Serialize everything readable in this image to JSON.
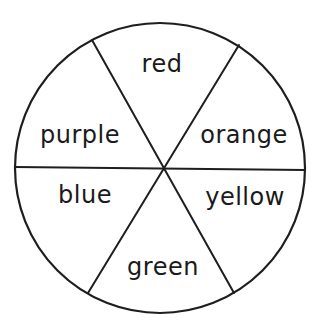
{
  "diagram": {
    "type": "color-wheel",
    "sectors": 6,
    "line_color": "#1e1e1e",
    "background": "#ffffff",
    "labels": {
      "top": "red",
      "upper_left": "purple",
      "upper_right": "orange",
      "lower_left": "blue",
      "lower_right": "yellow",
      "bottom": "green"
    },
    "order_clockwise_from_top": [
      "red",
      "orange",
      "yellow",
      "green",
      "blue",
      "purple"
    ]
  }
}
